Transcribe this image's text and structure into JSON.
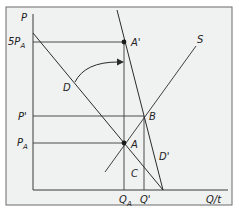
{
  "colors": {
    "background": "#ffffff",
    "panel": "#f0f1f1",
    "frame": "#6b6b6b",
    "line": "#2b2b2b"
  },
  "axes": {
    "y_label": "P",
    "x_label": "Q/t"
  },
  "price_labels": {
    "sp_a_main": "5P",
    "sp_a_sub": "A",
    "p_prime": "P'",
    "p_a_main": "P",
    "p_a_sub": "A"
  },
  "quantity_labels": {
    "q_a_main": "Q",
    "q_a_sub": "A",
    "q_prime": "Q'"
  },
  "curve_labels": {
    "demand": "D",
    "demand_prime": "D'",
    "supply": "S"
  },
  "point_labels": {
    "a": "A",
    "a_prime": "A'",
    "b": "B",
    "c": "C"
  }
}
